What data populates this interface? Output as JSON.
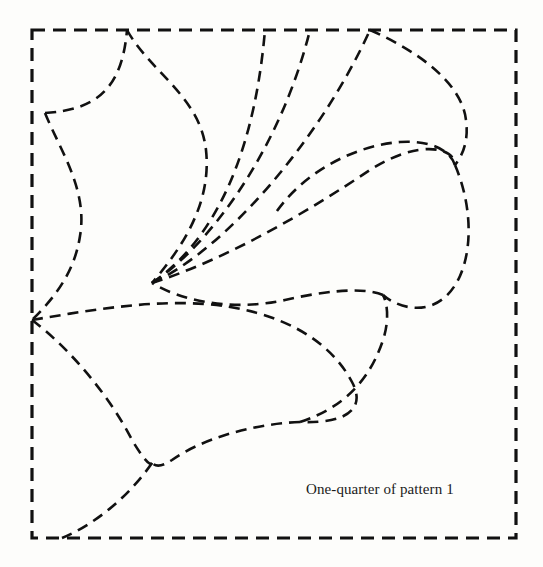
{
  "figure": {
    "caption": "One-quarter of pattern 1",
    "background_color": "#fdfdfb",
    "stroke_color": "#111111",
    "border": {
      "style": "dashed",
      "x": 32,
      "y": 30,
      "width": 484,
      "height": 508,
      "stroke_width": 3.2,
      "dash": "13 8"
    },
    "curves": {
      "stroke_width": 2.6,
      "dash": "11 7",
      "paths": [
        {
          "name": "upper-left-teardrop",
          "d": "M 45 113 C 95 110 122 90 127 30"
        },
        {
          "name": "upper-left-teardrop-body",
          "d": "M 127 30 C 150 72 200 96 206 150 C 212 205 180 250 152 283"
        },
        {
          "name": "left-lobe-inner",
          "d": "M 45 113 C 60 150 88 190 80 236 C 74 276 50 302 32 320"
        },
        {
          "name": "center-fan-strand-a",
          "d": "M 152 283 C 200 250 252 180 265 30"
        },
        {
          "name": "center-fan-strand-b",
          "d": "M 152 283 C 210 245 280 150 310 30"
        },
        {
          "name": "center-fan-strand-c",
          "d": "M 152 283 C 225 250 320 140 370 30"
        },
        {
          "name": "right-upper-teardrop",
          "d": "M 370 30 C 420 52 462 84 466 120 C 469 142 462 156 455 165"
        },
        {
          "name": "right-upper-teardrop-lower",
          "d": "M 455 165 C 450 150 430 140 400 142 C 350 146 300 176 275 214"
        },
        {
          "name": "mid-right-petal-top",
          "d": "M 152 283 C 230 258 310 210 370 170 C 420 138 455 148 455 165"
        },
        {
          "name": "mid-right-petal-bottom",
          "d": "M 455 165 C 470 200 474 244 460 276 C 440 320 400 310 383 295"
        },
        {
          "name": "mid-right-petal-close",
          "d": "M 383 295 C 362 286 320 292 285 300 C 230 312 180 300 152 283"
        },
        {
          "name": "lower-center-petal-top",
          "d": "M 32 320 C 90 310 150 300 205 304 C 280 310 330 340 352 382 C 366 408 348 424 300 422"
        },
        {
          "name": "lower-center-petal-bottom",
          "d": "M 300 422 C 250 424 200 440 172 460 C 160 468 155 466 152 463"
        },
        {
          "name": "bottom-left-lobe",
          "d": "M 32 320 C 72 350 112 400 132 440 C 144 460 150 466 152 463"
        },
        {
          "name": "bottom-left-lobe-close",
          "d": "M 152 463 C 130 495 96 524 62 538"
        },
        {
          "name": "lower-right-petal",
          "d": "M 300 422 C 330 412 366 392 383 340 C 389 322 388 304 383 295"
        }
      ]
    }
  }
}
